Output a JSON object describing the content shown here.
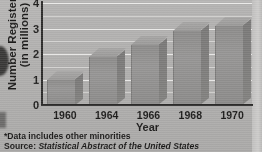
{
  "chart_data": {
    "type": "bar",
    "title": "",
    "categories": [
      "1960",
      "1964",
      "1966",
      "1968",
      "1970"
    ],
    "values": [
      1.0,
      1.9,
      2.35,
      2.9,
      3.1
    ],
    "series": [
      {
        "name": "Number Registered",
        "values": [
          1.0,
          1.9,
          2.35,
          2.9,
          3.1
        ]
      }
    ],
    "xlabel": "Year",
    "ylabel": "Number Registered*",
    "ylabel_line2": "(in millions)",
    "ylim": [
      0,
      4
    ],
    "yticks": [
      0,
      1,
      2,
      3,
      4
    ],
    "ytick_labels": [
      "0",
      "1",
      "2",
      "3",
      "4"
    ],
    "grid": true,
    "grid_minor_step": 0.5,
    "legend": "none",
    "style": "3d-bars-grayscale-scan",
    "bar_color": "#938f89"
  },
  "axes": {
    "y_title_line1": "Number Registered*",
    "y_title_line2": "(in millions)",
    "x_title": "Year"
  },
  "footnotes": {
    "note": "*Data includes other minorities",
    "source_label": "Source: ",
    "source_title": "Statistical Abstract of the United States"
  },
  "colors": {
    "background": "#b2aea7",
    "gridline": "#efece6",
    "axis": "#2e2b27",
    "bar_face": "#938f89",
    "bar_side": "#7e7a75",
    "bar_top": "#a4a09a",
    "text": "#1d1b18"
  }
}
